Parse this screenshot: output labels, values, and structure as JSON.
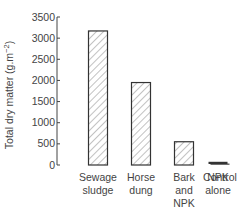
{
  "chart_data": {
    "type": "bar",
    "title": "",
    "xlabel": "",
    "ylabel": "Total dry matter (g.m⁻²)",
    "ylabel_main": "Total dry matter (g.m",
    "ylabel_sup": "−2",
    "ylabel_close": ")",
    "ylim": [
      0,
      3500
    ],
    "yticks": [
      0,
      500,
      1000,
      1500,
      2000,
      2500,
      3000,
      3500
    ],
    "grid": false,
    "legend": "none",
    "categories": [
      "Sewage sludge",
      "Horse dung",
      "Bark and NPK",
      "NPK alone",
      "Control"
    ],
    "category_lines": [
      [
        "Sewage",
        "sludge"
      ],
      [
        "Horse",
        "dung"
      ],
      [
        "Bark",
        "and",
        "NPK"
      ],
      [
        "NPK",
        "alone"
      ],
      [
        "Control"
      ]
    ],
    "values": [
      3170,
      1950,
      550,
      50,
      20
    ],
    "bar_style": "hatched",
    "colors": {
      "bar_stroke": "#333333",
      "hatch": "#666666",
      "axis": "#444444"
    }
  }
}
